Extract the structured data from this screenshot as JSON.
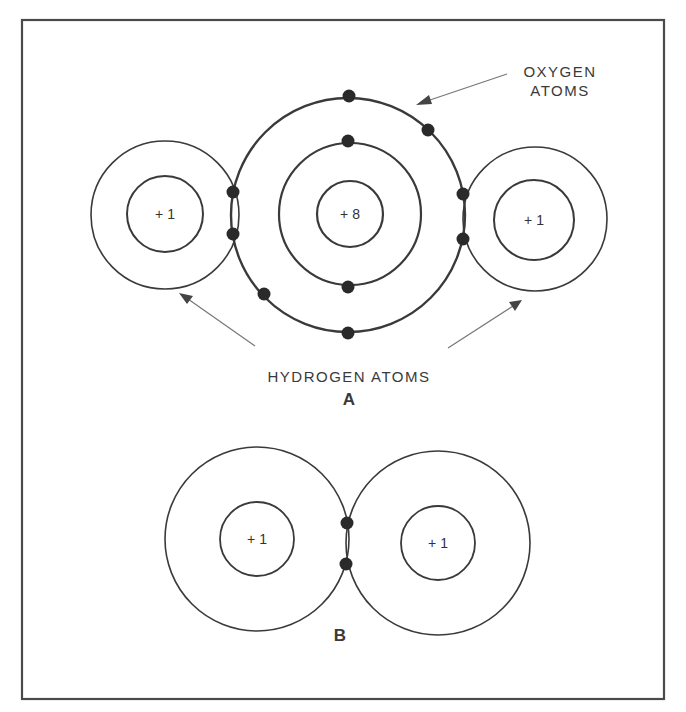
{
  "diagram": {
    "frame": {
      "x": 22,
      "y": 20,
      "width": 642,
      "height": 679
    },
    "colors": {
      "line": "#3a3a3a",
      "electron": "#2a2a2a",
      "arrow": "#777777",
      "background": "#ffffff"
    },
    "labels": {
      "oxygen_line1": "OXYGEN",
      "oxygen_line2": "ATOMS",
      "hydrogen": "HYDROGEN ATOMS",
      "panel_a": "A",
      "panel_b": "B"
    },
    "panel_a": {
      "oxygen": {
        "nucleus_charge": "+ 8",
        "center": [
          349,
          214
        ],
        "shells": [
          {
            "radius": 117,
            "electrons": 8
          },
          {
            "radius": 71,
            "electrons": 2
          }
        ],
        "nucleus_radius": 33
      },
      "hydrogen_left": {
        "nucleus_charge": "+ 1",
        "center": [
          165,
          215
        ],
        "outer_radius": 74,
        "inner_radius": 38
      },
      "hydrogen_right": {
        "nucleus_charge": "+ 1",
        "center": [
          535,
          219
        ],
        "outer_radius": 72,
        "inner_radius": 40
      }
    },
    "panel_b": {
      "hydrogen_left": {
        "nucleus_charge": "+ 1",
        "center": [
          257,
          539
        ],
        "outer_radius": 92,
        "inner_radius": 37
      },
      "hydrogen_right": {
        "nucleus_charge": "+ 1",
        "center": [
          438,
          543
        ],
        "outer_radius": 92,
        "inner_radius": 37
      },
      "shared_electrons": 2
    }
  }
}
